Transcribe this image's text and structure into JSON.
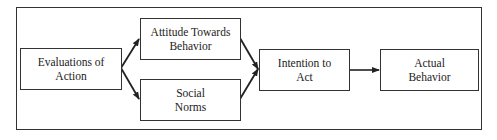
{
  "diagram": {
    "nodes": [
      {
        "id": "evaluations",
        "lines": [
          "Evaluations of",
          "Action"
        ]
      },
      {
        "id": "attitude",
        "lines": [
          "Attitude Towards",
          "Behavior"
        ]
      },
      {
        "id": "social_norms",
        "lines": [
          "Social",
          "Norms"
        ]
      },
      {
        "id": "intention",
        "lines": [
          "Intention to",
          "Act"
        ]
      },
      {
        "id": "actual_behavior",
        "lines": [
          "Actual",
          "Behavior"
        ]
      }
    ],
    "edges": [
      {
        "from": "evaluations",
        "to": "attitude"
      },
      {
        "from": "evaluations",
        "to": "social_norms"
      },
      {
        "from": "attitude",
        "to": "intention"
      },
      {
        "from": "social_norms",
        "to": "intention"
      },
      {
        "from": "intention",
        "to": "actual_behavior"
      }
    ]
  }
}
